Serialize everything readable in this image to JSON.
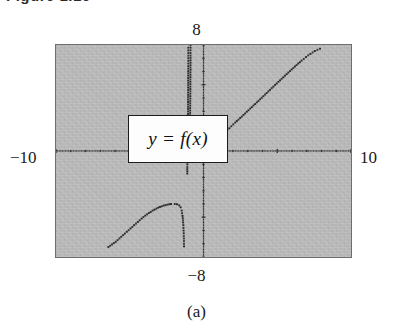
{
  "figure": {
    "header": "Figure 1.16",
    "sub_caption": "(a)"
  },
  "equation_label": {
    "text": "y = f(x)"
  },
  "axis_labels": {
    "top": "8",
    "bottom": "−8",
    "left": "−10",
    "right": "10"
  },
  "chart_data": {
    "type": "line",
    "title": "y = f(x)",
    "xlabel": "",
    "ylabel": "",
    "xlim": [
      -10,
      10
    ],
    "ylim": [
      -8,
      8
    ],
    "grid": false,
    "legend": null,
    "render_style": "dotted-pixel-trace",
    "window_labels": {
      "xmin": "−10",
      "xmax": "10",
      "ymin": "−8",
      "ymax": "8"
    },
    "axes": {
      "x_axis_y": 0,
      "y_axis_x": 0,
      "tick_spacing_x": 1,
      "tick_spacing_y": 1,
      "tick_style": "dotted-with-unit-marks"
    },
    "asymptotes": {
      "vertical": [
        -1.0
      ]
    },
    "series": [
      {
        "name": "branch-lower-left",
        "comment": "rises from bottom-left, local max, then falls steeply to the vertical asymptote",
        "points": [
          [
            -6.45,
            -7.25
          ],
          [
            -6.2,
            -7.05
          ],
          [
            -5.95,
            -6.85
          ],
          [
            -5.7,
            -6.6
          ],
          [
            -5.45,
            -6.35
          ],
          [
            -5.2,
            -6.1
          ],
          [
            -4.95,
            -5.85
          ],
          [
            -4.7,
            -5.6
          ],
          [
            -4.45,
            -5.35
          ],
          [
            -4.2,
            -5.1
          ],
          [
            -3.95,
            -4.88
          ],
          [
            -3.7,
            -4.68
          ],
          [
            -3.45,
            -4.5
          ],
          [
            -3.2,
            -4.35
          ],
          [
            -2.95,
            -4.22
          ],
          [
            -2.7,
            -4.12
          ],
          [
            -2.45,
            -4.05
          ],
          [
            -2.2,
            -4.0
          ],
          [
            -1.95,
            -4.0
          ],
          [
            -1.8,
            -4.02
          ],
          [
            -1.65,
            -4.1
          ],
          [
            -1.55,
            -4.25
          ],
          [
            -1.48,
            -4.5
          ],
          [
            -1.42,
            -4.9
          ],
          [
            -1.38,
            -5.4
          ],
          [
            -1.35,
            -6.0
          ],
          [
            -1.33,
            -6.6
          ],
          [
            -1.32,
            -7.2
          ]
        ]
      },
      {
        "name": "branch-left-of-asymptote",
        "comment": "near-vertical dotted branch climbing to the top of the window just left of the asymptote",
        "points": [
          [
            -1.1,
            -1.7
          ],
          [
            -1.1,
            -1.2
          ],
          [
            -1.09,
            -0.6
          ],
          [
            -1.08,
            0.2
          ],
          [
            -1.07,
            1.0
          ],
          [
            -1.06,
            1.9
          ],
          [
            -1.05,
            2.8
          ],
          [
            -1.05,
            3.7
          ],
          [
            -1.04,
            4.6
          ],
          [
            -1.04,
            5.5
          ],
          [
            -1.03,
            6.4
          ],
          [
            -1.03,
            7.2
          ],
          [
            -1.03,
            7.8
          ]
        ]
      },
      {
        "name": "branch-right-of-asymptote",
        "comment": "comes down from the top just right of the asymptote, bottoms out, then rises linearly to the upper right",
        "points": [
          [
            -0.88,
            8.0
          ],
          [
            -0.88,
            7.2
          ],
          [
            -0.88,
            6.3
          ],
          [
            -0.89,
            5.4
          ],
          [
            -0.89,
            4.5
          ],
          [
            -0.9,
            3.6
          ],
          [
            -0.91,
            2.7
          ],
          [
            -0.92,
            1.9
          ],
          [
            -0.93,
            1.2
          ],
          [
            -0.95,
            0.7
          ],
          [
            -0.98,
            0.4
          ],
          [
            -0.8,
            0.28
          ],
          [
            -0.55,
            0.22
          ],
          [
            -0.3,
            0.22
          ],
          [
            -0.05,
            0.26
          ],
          [
            0.25,
            0.38
          ],
          [
            0.6,
            0.6
          ],
          [
            0.95,
            0.92
          ],
          [
            1.35,
            1.3
          ],
          [
            1.75,
            1.72
          ],
          [
            2.15,
            2.15
          ],
          [
            2.6,
            2.6
          ],
          [
            3.05,
            3.08
          ],
          [
            3.5,
            3.55
          ],
          [
            3.95,
            4.02
          ],
          [
            4.4,
            4.5
          ],
          [
            4.85,
            4.98
          ],
          [
            5.3,
            5.45
          ],
          [
            5.75,
            5.92
          ],
          [
            6.2,
            6.38
          ],
          [
            6.65,
            6.82
          ],
          [
            7.1,
            7.22
          ],
          [
            7.55,
            7.55
          ],
          [
            7.9,
            7.72
          ]
        ]
      }
    ]
  }
}
